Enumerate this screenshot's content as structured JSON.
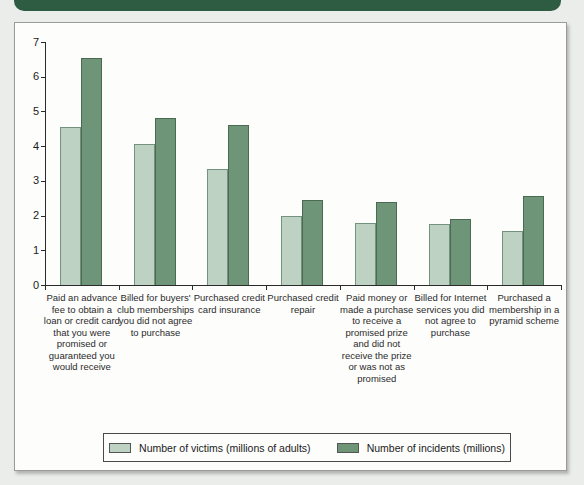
{
  "page": {
    "background_color": "#ebedea",
    "header_band_color": "#2d5c42",
    "panel_background": "#fdfdfc"
  },
  "chart_data": {
    "type": "bar",
    "title": "",
    "xlabel": "",
    "ylabel": "",
    "ylim": [
      0,
      7
    ],
    "yticks": [
      0,
      1,
      2,
      3,
      4,
      5,
      6,
      7
    ],
    "grid": false,
    "legend_position": "bottom",
    "categories": [
      "Paid an advance fee to obtain a loan or credit card that you were promised or guaranteed you would receive",
      "Billed for buyers' club memberships you did not agree to purchase",
      "Purchased credit card insurance",
      "Purchased credit repair",
      "Paid money or made a purchase to receive a promised prize and did not receive the prize or was not as promised",
      "Billed for Internet services you did not agree to purchase",
      "Purchased a membership in a pyramid scheme"
    ],
    "series": [
      {
        "name": "Number of victims (millions of adults)",
        "color": "#bdd2c2",
        "border_color": "#74937f",
        "values": [
          4.55,
          4.05,
          3.35,
          2.0,
          1.8,
          1.75,
          1.55
        ]
      },
      {
        "name": "Number of incidents (millions)",
        "color": "#6f9579",
        "border_color": "#4a6a52",
        "values": [
          6.55,
          4.8,
          4.6,
          2.45,
          2.4,
          1.9,
          2.55
        ]
      }
    ]
  }
}
